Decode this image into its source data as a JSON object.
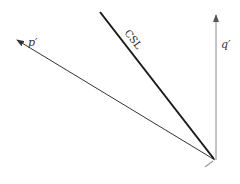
{
  "diagram": {
    "labels": {
      "p_axis": "p′",
      "q_axis": "q′",
      "csl": "CSL"
    },
    "colors": {
      "axis": "#333333",
      "q_axis": "#777777",
      "csl": "#1a1a1a",
      "background": "#ffffff"
    },
    "geometry": {
      "origin": [
        215,
        160
      ],
      "p_axis_tip": [
        16,
        40
      ],
      "q_axis_tip": [
        215,
        15
      ],
      "csl_end": [
        100,
        12
      ]
    }
  }
}
